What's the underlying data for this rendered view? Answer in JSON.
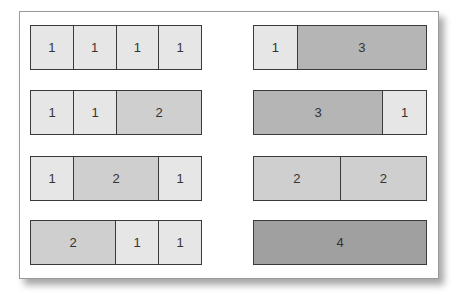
{
  "colors": {
    "1": "#e6e6e6",
    "2": "#cfcfcf",
    "3": "#b5b5b5",
    "4": "#a0a0a0"
  },
  "bars": [
    {
      "column": "left",
      "segments": [
        1,
        1,
        1,
        1
      ]
    },
    {
      "column": "left",
      "segments": [
        1,
        1,
        2
      ]
    },
    {
      "column": "left",
      "segments": [
        1,
        2,
        1
      ]
    },
    {
      "column": "left",
      "segments": [
        2,
        1,
        1
      ]
    },
    {
      "column": "right",
      "segments": [
        1,
        3
      ]
    },
    {
      "column": "right",
      "segments": [
        3,
        1
      ]
    },
    {
      "column": "right",
      "segments": [
        2,
        2
      ]
    },
    {
      "column": "right",
      "segments": [
        4
      ]
    }
  ]
}
